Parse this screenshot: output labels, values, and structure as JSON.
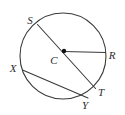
{
  "figure": {
    "kind": "circle-geometry-diagram",
    "background_color": "#ffffff",
    "stroke_color": "#3a3a3a",
    "label_color": "#2b2b2b",
    "stroke_width": 1.1,
    "width": 125,
    "height": 115,
    "circle": {
      "name": "circle-C",
      "cx": 63,
      "cy": 56,
      "r": 43
    },
    "center_point": {
      "name": "center-point-C",
      "x": 64,
      "y": 51,
      "radius": 2.2
    },
    "segments": [
      {
        "name": "diameter-ST",
        "label": "ST",
        "type": "diameter",
        "x1": 37.5,
        "y1": 24.5,
        "x2": 95.5,
        "y2": 88.5
      },
      {
        "name": "radius-CR",
        "label": "CR",
        "type": "radius",
        "x1": 64,
        "y1": 51.5,
        "x2": 105.5,
        "y2": 52.5
      },
      {
        "name": "chord-XY",
        "label": "XY",
        "type": "chord",
        "x1": 22.5,
        "y1": 70,
        "x2": 88,
        "y2": 98
      }
    ],
    "labels": [
      {
        "name": "label-S",
        "text": "S",
        "x": 30,
        "y": 24
      },
      {
        "name": "label-R",
        "text": "R",
        "x": 112,
        "y": 59
      },
      {
        "name": "label-C",
        "text": "C",
        "x": 54,
        "y": 64
      },
      {
        "name": "label-X",
        "text": "X",
        "x": 13,
        "y": 72
      },
      {
        "name": "label-T",
        "text": "T",
        "x": 101,
        "y": 96
      },
      {
        "name": "label-Y",
        "text": "Y",
        "x": 85,
        "y": 109
      }
    ]
  }
}
